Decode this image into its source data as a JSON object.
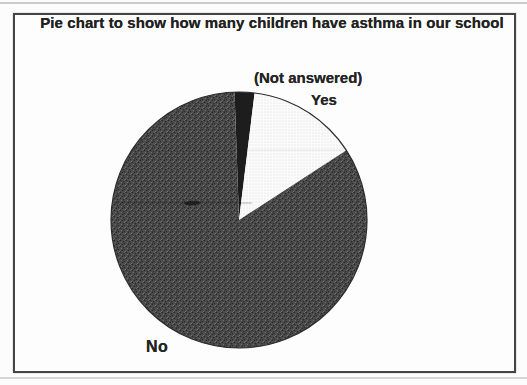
{
  "title": "Pie chart to show how many children have asthma in our school",
  "chart_data": {
    "type": "pie",
    "title": "Pie chart to show how many children have asthma in our school",
    "values_shown": false,
    "legend_position": "floating-labels",
    "start_angle_deg": -2,
    "clockwise": true,
    "segments": [
      {
        "label": "(Not answered)",
        "value_pct": 2.5,
        "pattern": "solid-black",
        "color": "#1d1d1d"
      },
      {
        "label": "Yes",
        "value_pct": 13.9,
        "pattern": "light-stipple",
        "color": "#fbfbfb"
      },
      {
        "label": "No",
        "value_pct": 83.6,
        "pattern": "dark-halftone",
        "color": "#474747"
      }
    ]
  },
  "frame": {
    "border_color": "#454545"
  },
  "page": {
    "background": "#fcfcfc"
  }
}
